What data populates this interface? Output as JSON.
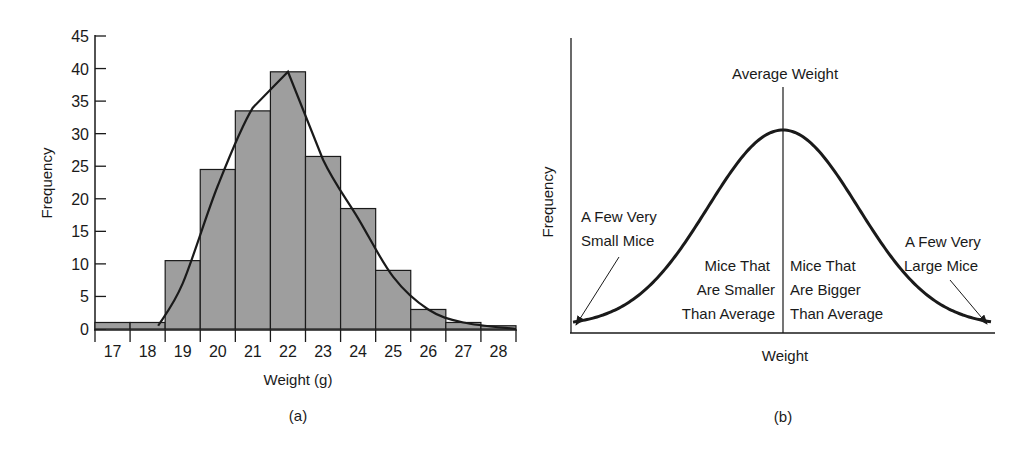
{
  "chart_data": [
    {
      "type": "bar",
      "panel_label": "(a)",
      "title": "",
      "xlabel": "Weight (g)",
      "ylabel": "Frequency",
      "categories": [
        "17",
        "18",
        "19",
        "20",
        "21",
        "22",
        "23",
        "24",
        "25",
        "26",
        "27",
        "28"
      ],
      "values": [
        1,
        1,
        10.5,
        24.5,
        33.5,
        39.5,
        26.5,
        18.5,
        9,
        3,
        1,
        0.5
      ],
      "ylim": [
        0,
        45
      ],
      "yticks": [
        0,
        5,
        10,
        15,
        20,
        25,
        30,
        35,
        40,
        45
      ],
      "grid": false,
      "bar_color": "#9e9e9e",
      "overlay_curve": {
        "type": "line",
        "description": "smooth fitted frequency curve over histogram",
        "x": [
          18.3,
          19,
          20,
          21,
          22,
          23,
          24,
          25,
          26,
          27,
          28.5
        ],
        "y": [
          0.5,
          7,
          22,
          34,
          39.5,
          26,
          17,
          8,
          3,
          1,
          0
        ]
      }
    },
    {
      "type": "line",
      "panel_label": "(b)",
      "title": "",
      "xlabel": "Weight",
      "ylabel": "Frequency",
      "description": "Idealized bell-shaped (normal) distribution of mouse weights",
      "annotations": [
        {
          "text": "Average Weight",
          "position": "top center, above vertical mean line"
        },
        {
          "text": "A Few Very Small Mice",
          "position": "left tail with arrow"
        },
        {
          "text": "Mice That Are Smaller Than Average",
          "position": "left of mean line"
        },
        {
          "text": "Mice That Are Bigger Than Average",
          "position": "right of mean line"
        },
        {
          "text": "A Few Very Large Mice",
          "position": "right tail with arrow"
        }
      ]
    }
  ],
  "panel_a": {
    "ylabel": "Frequency",
    "xlabel": "Weight (g)",
    "caption": "(a)",
    "yticks": [
      "0",
      "5",
      "10",
      "15",
      "20",
      "25",
      "30",
      "35",
      "40",
      "45"
    ],
    "xticks": [
      "17",
      "18",
      "19",
      "20",
      "21",
      "22",
      "23",
      "24",
      "25",
      "26",
      "27",
      "28"
    ]
  },
  "panel_b": {
    "ylabel": "Frequency",
    "xlabel": "Weight",
    "caption": "(b)",
    "mean_label": "Average Weight",
    "small_tail": [
      "A Few Very",
      "Small Mice"
    ],
    "smaller": [
      "Mice That",
      "Are Smaller",
      "Than Average"
    ],
    "bigger": [
      "Mice That",
      "Are Bigger",
      "Than Average"
    ],
    "large_tail": [
      "A Few Very",
      "Large Mice"
    ]
  }
}
